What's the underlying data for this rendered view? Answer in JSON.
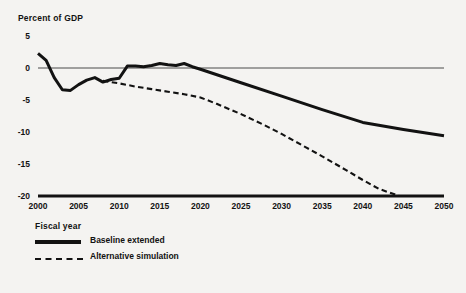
{
  "chart_data": {
    "type": "line",
    "title": "",
    "ylabel": "Percent of GDP",
    "xlabel": "Fiscal year",
    "xlim": [
      2000,
      2050
    ],
    "ylim": [
      -20,
      5
    ],
    "yticks": [
      5,
      0,
      -5,
      -10,
      -15,
      -20
    ],
    "ytick_labels": [
      "5",
      "0",
      "-5",
      "-10",
      "-15",
      "-20"
    ],
    "xticks": [
      2000,
      2005,
      2010,
      2015,
      2020,
      2025,
      2030,
      2035,
      2040,
      2045,
      2050
    ],
    "xtick_labels": [
      "2000",
      "2005",
      "2010",
      "2015",
      "2020",
      "2025",
      "2030",
      "2035",
      "2040",
      "2045",
      "2050"
    ],
    "grid": false,
    "zero_line": true,
    "legend_position": "below-axis-left",
    "series": [
      {
        "name": "Baseline extended",
        "style": "solid",
        "color": "#121212",
        "x": [
          2000,
          2001,
          2002,
          2003,
          2004,
          2005,
          2006,
          2007,
          2008,
          2009,
          2010,
          2011,
          2012,
          2013,
          2014,
          2015,
          2016,
          2017,
          2018,
          2019,
          2020,
          2025,
          2030,
          2035,
          2040,
          2045,
          2050
        ],
        "values": [
          2.3,
          1.2,
          -1.5,
          -3.4,
          -3.5,
          -2.6,
          -1.9,
          -1.5,
          -2.2,
          -1.8,
          -1.6,
          0.3,
          0.3,
          0.2,
          0.4,
          0.7,
          0.5,
          0.4,
          0.7,
          0.2,
          -0.2,
          -2.3,
          -4.4,
          -6.5,
          -8.5,
          -9.6,
          -10.6
        ]
      },
      {
        "name": "Alternative simulation",
        "style": "dashed",
        "color": "#121212",
        "x": [
          2008,
          2010,
          2012,
          2014,
          2016,
          2018,
          2020,
          2022,
          2025,
          2028,
          2030,
          2033,
          2035,
          2038,
          2040,
          2042,
          2044.5
        ],
        "values": [
          -2.0,
          -2.4,
          -2.9,
          -3.3,
          -3.7,
          -4.1,
          -4.6,
          -5.6,
          -7.2,
          -9.0,
          -10.3,
          -12.4,
          -13.8,
          -16.0,
          -17.5,
          -18.9,
          -20.0
        ]
      }
    ]
  },
  "legend": {
    "items": [
      {
        "label": "Baseline extended",
        "style": "solid"
      },
      {
        "label": "Alternative simulation",
        "style": "dashed"
      }
    ]
  }
}
